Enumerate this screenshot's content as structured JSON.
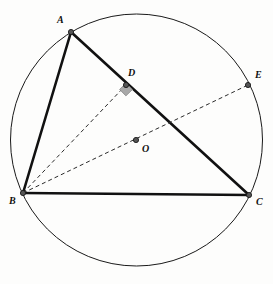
{
  "figure": {
    "background_color": "#fdfdfc",
    "width": 273,
    "height": 284
  },
  "style": {
    "circle_stroke": "#1a1a1a",
    "circle_stroke_width": 1.0,
    "solid_stroke": "#111111",
    "solid_stroke_width": 2.6,
    "dashed_stroke": "#2b2b2b",
    "dashed_stroke_width": 1.0,
    "dash_pattern": "4,3",
    "vertex_fill": "#555555",
    "vertex_stroke": "#1a1a1a",
    "vertex_radius": 2.6,
    "right_angle_fill": "#a8a8a8",
    "right_angle_stroke": "#8a8a8a",
    "label_color": "#101010"
  },
  "circle": {
    "name": "circumcircle",
    "cx": 136.5,
    "cy": 140,
    "r": 126
  },
  "points": [
    {
      "id": "A",
      "label": "A",
      "x": 71,
      "y": 32,
      "label_x": 57,
      "label_y": 15,
      "marker": true
    },
    {
      "id": "B",
      "label": "B",
      "x": 23,
      "y": 193,
      "label_x": 9,
      "label_y": 196,
      "marker": true
    },
    {
      "id": "C",
      "label": "C",
      "x": 249,
      "y": 195,
      "label_x": 256,
      "label_y": 197,
      "marker": true
    },
    {
      "id": "D",
      "label": "D",
      "x": 126,
      "y": 85,
      "label_x": 128,
      "label_y": 68,
      "marker": true
    },
    {
      "id": "E",
      "label": "E",
      "x": 248,
      "y": 85,
      "label_x": 255,
      "label_y": 70,
      "marker": true
    },
    {
      "id": "O",
      "label": "O",
      "x": 136,
      "y": 140,
      "label_x": 142,
      "label_y": 144,
      "marker": true
    }
  ],
  "segments": [
    {
      "id": "AB",
      "from": "A",
      "to": "B",
      "style": "solid",
      "x1": 71,
      "y1": 32,
      "x2": 23,
      "y2": 193
    },
    {
      "id": "AC",
      "from": "A",
      "to": "C",
      "style": "solid",
      "x1": 71,
      "y1": 32,
      "x2": 249,
      "y2": 195
    },
    {
      "id": "BC",
      "from": "B",
      "to": "C",
      "style": "solid",
      "x1": 23,
      "y1": 193,
      "x2": 249,
      "y2": 195
    },
    {
      "id": "BD",
      "from": "B",
      "to": "D",
      "style": "dashed",
      "x1": 23,
      "y1": 193,
      "x2": 126,
      "y2": 85
    },
    {
      "id": "BE",
      "from": "B",
      "to": "E",
      "style": "dashed",
      "x1": 23,
      "y1": 193,
      "x2": 248,
      "y2": 85
    }
  ],
  "right_angle": {
    "at": "D",
    "vertex_x": 126,
    "vertex_y": 85,
    "size": 9,
    "rotation_deg": 46,
    "description": "right angle mark at D between BD and AC"
  }
}
